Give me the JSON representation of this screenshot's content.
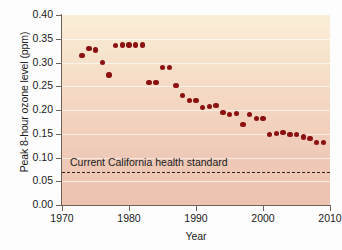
{
  "chart_data": {
    "type": "scatter",
    "title": "",
    "xlabel": "Year",
    "ylabel": "Peak 8-hour ozone level (ppm)",
    "xlim": [
      1970,
      2010
    ],
    "ylim": [
      0.0,
      0.4
    ],
    "xticks": [
      "1970",
      "1980",
      "1990",
      "2000",
      "2010"
    ],
    "xtick_values": [
      1970,
      1980,
      1990,
      2000,
      2010
    ],
    "yticks": [
      "0.00",
      "0.05",
      "0.10",
      "0.15",
      "0.20",
      "0.25",
      "0.30",
      "0.35",
      "0.40"
    ],
    "ytick_values": [
      0.0,
      0.05,
      0.1,
      0.15,
      0.2,
      0.25,
      0.3,
      0.35,
      0.4
    ],
    "grid": true,
    "legend": "none",
    "marker_color": "#8c1010",
    "series": [
      {
        "name": "Peak 8-hour ozone level",
        "x": [
          1973,
          1974,
          1975,
          1976,
          1977,
          1978,
          1979,
          1980,
          1981,
          1982,
          1983,
          1984,
          1985,
          1986,
          1987,
          1988,
          1989,
          1990,
          1991,
          1992,
          1993,
          1994,
          1995,
          1996,
          1997,
          1998,
          1999,
          2000,
          2001,
          2002,
          2003,
          2004,
          2005,
          2006,
          2007,
          2008,
          2009
        ],
        "values": [
          0.315,
          0.33,
          0.326,
          0.3,
          0.274,
          0.336,
          0.337,
          0.337,
          0.337,
          0.337,
          0.258,
          0.258,
          0.289,
          0.289,
          0.251,
          0.23,
          0.22,
          0.22,
          0.205,
          0.208,
          0.209,
          0.195,
          0.19,
          0.193,
          0.169,
          0.19,
          0.182,
          0.182,
          0.149,
          0.15,
          0.153,
          0.148,
          0.148,
          0.143,
          0.14,
          0.132,
          0.131
        ]
      }
    ],
    "annotations": [
      {
        "name": "california-health-standard",
        "text": "Current California health standard",
        "type": "hline",
        "y": 0.07,
        "style": "dashed"
      }
    ]
  }
}
